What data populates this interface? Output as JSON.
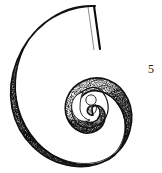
{
  "figure": {
    "number_label": "5",
    "caption": "",
    "technique": "stipple-and-line ink drawing",
    "view": "lateral"
  },
  "colors": {
    "background": "#ffffff",
    "ink": "#111111",
    "ink_mid": "#4a4a4a",
    "ink_light": "#8a8a8a",
    "highlight": "#ffffff",
    "label": "#1a1a1a"
  },
  "canvas": {
    "width": 162,
    "height": 173
  },
  "shell": {
    "bounds": {
      "left": 13,
      "top": 5,
      "right": 128,
      "bottom": 165
    },
    "center": {
      "x": 78,
      "y": 97
    },
    "coiling": "involute-logarithmic",
    "whorl_count": 3,
    "umbilicus": {
      "shape": "crescent",
      "center_x": 80,
      "center_y": 101,
      "radius": 10,
      "fill": "#ffffff"
    },
    "aperture": {
      "position": "top",
      "x1": 94,
      "y1": 6,
      "x2": 100,
      "y2": 49
    },
    "rib_count": 34,
    "growth_line_count": 9
  },
  "icons": {
    "shell_outline": "spiral-shell-icon",
    "umbilicus": "umbilicus-icon",
    "aperture": "aperture-icon"
  }
}
